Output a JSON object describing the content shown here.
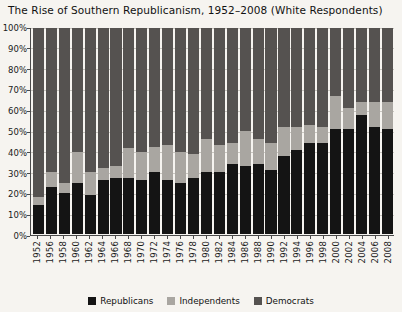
{
  "chart_data": {
    "type": "bar",
    "subtype": "stacked-percentage-column",
    "title": "The Rise of Southern Republicanism, 1952–2008 (White Respondents)",
    "xlabel": "",
    "ylabel": "",
    "ylim": [
      0,
      100
    ],
    "grid": true,
    "legend_position": "bottom-center",
    "ytick_labels": [
      "0%",
      "10%",
      "20%",
      "30%",
      "40%",
      "50%",
      "60%",
      "70%",
      "80%",
      "90%",
      "100%"
    ],
    "ytick_values": [
      0,
      10,
      20,
      30,
      40,
      50,
      60,
      70,
      80,
      90,
      100
    ],
    "categories": [
      "1952",
      "1956",
      "1958",
      "1960",
      "1962",
      "1964",
      "1966",
      "1968",
      "1970",
      "1972",
      "1974",
      "1976",
      "1978",
      "1980",
      "1982",
      "1984",
      "1986",
      "1988",
      "1990",
      "1992",
      "1994",
      "1996",
      "1998",
      "2000",
      "2002",
      "2004",
      "2006",
      "2008"
    ],
    "series": [
      {
        "name": "Republicans",
        "color": "#141414",
        "values": [
          14,
          23,
          20,
          25,
          19,
          26,
          27,
          27,
          26,
          30,
          26,
          25,
          27,
          30,
          30,
          34,
          33,
          34,
          31,
          38,
          41,
          44,
          44,
          51,
          51,
          58,
          52,
          51
        ]
      },
      {
        "name": "Independents",
        "color": "#a9a6a1",
        "values": [
          4,
          7,
          5,
          15,
          11,
          6,
          6,
          15,
          14,
          12,
          17,
          15,
          12,
          16,
          13,
          10,
          17,
          12,
          13,
          14,
          11,
          9,
          8,
          16,
          10,
          6,
          12,
          13
        ]
      },
      {
        "name": "Democrats",
        "color": "#555250",
        "values": [
          82,
          70,
          75,
          60,
          70,
          68,
          67,
          58,
          60,
          58,
          57,
          60,
          61,
          54,
          57,
          56,
          50,
          54,
          56,
          48,
          48,
          47,
          48,
          33,
          39,
          36,
          36,
          36
        ]
      }
    ]
  },
  "legend": {
    "items": [
      {
        "label": "Republicans",
        "swatch_class": "sw-rep"
      },
      {
        "label": "Independents",
        "swatch_class": "sw-ind"
      },
      {
        "label": "Democrats",
        "swatch_class": "sw-dem"
      }
    ]
  },
  "colors": {
    "republicans": "#141414",
    "independents": "#a9a6a1",
    "democrats": "#555250",
    "background": "#f6f4f0",
    "axis": "#4a4a4a",
    "gridline": "#c9c6c0"
  }
}
